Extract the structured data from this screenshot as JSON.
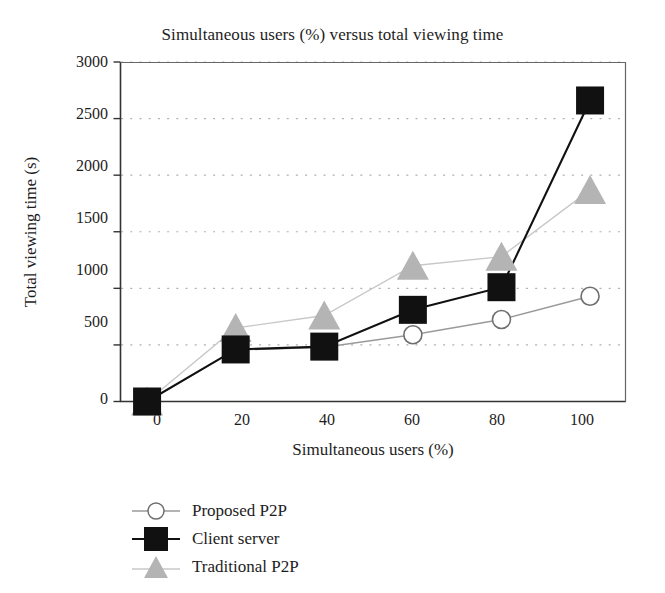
{
  "chart_data": {
    "type": "line",
    "title": "Simultaneous users (%) versus total viewing time",
    "xlabel": "Simultaneous users (%)",
    "ylabel": "Total viewing time (s)",
    "x": [
      0,
      20,
      40,
      60,
      80,
      100
    ],
    "xticks": [
      "0",
      "20",
      "40",
      "60",
      "80",
      "100"
    ],
    "yticks": [
      "0",
      "500",
      "1000",
      "1500",
      "2000",
      "2500",
      "3000"
    ],
    "xlim": [
      -6,
      108
    ],
    "ylim": [
      0,
      3000
    ],
    "grid": "horizontal-dotted",
    "legend_position": "below-left",
    "series": [
      {
        "name": "Proposed P2P",
        "marker": "open-circle",
        "color": "#9a9a9a",
        "values": [
          0,
          455,
          480,
          590,
          725,
          930
        ]
      },
      {
        "name": "Client server",
        "marker": "filled-square",
        "color": "#111111",
        "values": [
          0,
          460,
          485,
          810,
          1010,
          2660
        ]
      },
      {
        "name": "Traditional P2P",
        "marker": "filled-triangle",
        "color": "#b4b4b4",
        "values": [
          0,
          650,
          760,
          1200,
          1280,
          1870
        ]
      }
    ]
  },
  "axis": {
    "ytick_labels": [
      "3000",
      "2500",
      "2000",
      "1500",
      "1000",
      "500",
      "0"
    ],
    "xtick_labels": [
      "0",
      "20",
      "40",
      "60",
      "80",
      "100"
    ]
  },
  "legend": {
    "items": [
      {
        "label": "Proposed P2P"
      },
      {
        "label": "Client server"
      },
      {
        "label": "Traditional P2P"
      }
    ]
  }
}
